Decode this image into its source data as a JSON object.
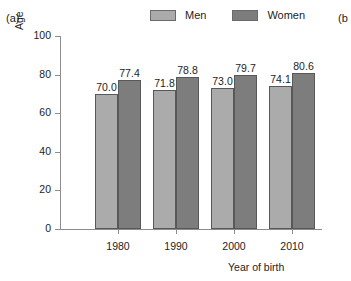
{
  "panels": {
    "current": "(a)",
    "next_partial": "(b"
  },
  "legend": {
    "position": "top-center",
    "entries": [
      {
        "label": "Men",
        "color": "#ababab",
        "swatch_name": "legend-swatch-men"
      },
      {
        "label": "Women",
        "color": "#7d7d7d",
        "swatch_name": "legend-swatch-women"
      }
    ]
  },
  "chart_data": {
    "type": "bar",
    "title": "",
    "subtitle": "",
    "xlabel": "Year of birth",
    "ylabel": "Age",
    "categories": [
      "1980",
      "1990",
      "2000",
      "2010"
    ],
    "series": [
      {
        "name": "Men",
        "color": "#ababab",
        "values": [
          70.0,
          71.8,
          73.0,
          74.1
        ]
      },
      {
        "name": "Women",
        "color": "#7d7d7d",
        "values": [
          77.4,
          78.8,
          79.7,
          80.6
        ]
      }
    ],
    "value_labels": [
      [
        "70.0",
        "77.4"
      ],
      [
        "71.8",
        "78.8"
      ],
      [
        "73.0",
        "79.7"
      ],
      [
        "74.1",
        "80.6"
      ]
    ],
    "ylim": [
      0,
      100
    ],
    "yticks": [
      0,
      20,
      40,
      60,
      80,
      100
    ],
    "ytick_labels": [
      "0",
      "20",
      "40",
      "60",
      "80",
      "100"
    ],
    "grid": false,
    "legend_position": "top"
  }
}
